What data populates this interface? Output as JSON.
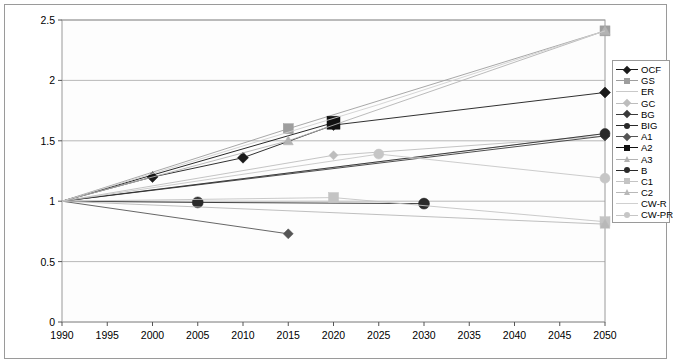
{
  "chart_data": {
    "type": "line",
    "title": "",
    "xlabel": "",
    "ylabel": "index (1990 = 1)",
    "xlim": [
      1990,
      2050
    ],
    "ylim": [
      0,
      2.5
    ],
    "yticks": [
      "0",
      "0.5",
      "1",
      "1.5",
      "2",
      "2.5"
    ],
    "ytick_values": [
      0,
      0.5,
      1,
      1.5,
      2,
      2.5
    ],
    "xticks": [
      "1990",
      "1995",
      "2000",
      "2005",
      "2010",
      "2015",
      "2020",
      "2025",
      "2030",
      "2035",
      "2040",
      "2045",
      "2050"
    ],
    "xtick_values": [
      1990,
      1995,
      2000,
      2005,
      2010,
      2015,
      2020,
      2025,
      2030,
      2035,
      2040,
      2045,
      2050
    ],
    "grid": "horizontal",
    "legend_position": "right",
    "series": [
      {
        "name": "OCF",
        "color": "#1a1a1a",
        "marker": "diamond",
        "marker_size": 5.5,
        "x": [
          1990,
          2000,
          2010,
          2020,
          2050
        ],
        "y": [
          1.0,
          1.2,
          1.36,
          1.63,
          1.9
        ]
      },
      {
        "name": "GS",
        "color": "#9e9e9e",
        "marker": "square",
        "marker_size": 5,
        "x": [
          1990,
          2015,
          2050
        ],
        "y": [
          1.0,
          1.6,
          2.41
        ]
      },
      {
        "name": "ER",
        "color": "#c9c9c9",
        "marker": "none",
        "marker_size": 0,
        "x": [
          1990,
          2050
        ],
        "y": [
          1.0,
          1.56
        ]
      },
      {
        "name": "GC",
        "color": "#bdbdbd",
        "marker": "diamond",
        "marker_size": 4.5,
        "x": [
          1990,
          2020,
          2050
        ],
        "y": [
          1.0,
          1.38,
          1.54
        ]
      },
      {
        "name": "BG",
        "color": "#3a3a3a",
        "marker": "diamond",
        "marker_size": 5,
        "x": [
          1990,
          2050
        ],
        "y": [
          1.0,
          1.54
        ]
      },
      {
        "name": "BIG",
        "color": "#2a2a2a",
        "marker": "circle",
        "marker_size": 5,
        "x": [
          1990,
          2050
        ],
        "y": [
          1.0,
          1.56
        ]
      },
      {
        "name": "A1",
        "color": "#555555",
        "marker": "diamond",
        "marker_size": 5,
        "x": [
          1990,
          2015
        ],
        "y": [
          1.0,
          0.73
        ]
      },
      {
        "name": "A2",
        "color": "#111111",
        "marker": "square",
        "marker_size": 6.5,
        "x": [
          1990,
          2020
        ],
        "y": [
          1.0,
          1.65
        ]
      },
      {
        "name": "A3",
        "color": "#b3b3b3",
        "marker": "triangle",
        "marker_size": 5,
        "x": [
          1990,
          2015,
          2050
        ],
        "y": [
          1.0,
          1.5,
          2.41
        ]
      },
      {
        "name": "B",
        "color": "#2a2a2a",
        "marker": "circle",
        "marker_size": 5.5,
        "x": [
          1990,
          2005,
          2030
        ],
        "y": [
          1.0,
          0.99,
          0.98
        ]
      },
      {
        "name": "C1",
        "color": "#c4c4c4",
        "marker": "square",
        "marker_size": 5,
        "x": [
          1990,
          2020,
          2050
        ],
        "y": [
          1.0,
          1.03,
          0.83
        ]
      },
      {
        "name": "C2",
        "color": "#b8b8b8",
        "marker": "triangle",
        "marker_size": 5,
        "x": [
          1990,
          2050
        ],
        "y": [
          1.0,
          0.81
        ]
      },
      {
        "name": "CW-R",
        "color": "#d0d0d0",
        "marker": "none",
        "marker_size": 0,
        "x": [
          1990,
          2025,
          2050
        ],
        "y": [
          1.0,
          1.8,
          2.41
        ]
      },
      {
        "name": "CW-PR",
        "color": "#c6c6c6",
        "marker": "circle",
        "marker_size": 5,
        "x": [
          1990,
          2025,
          2050
        ],
        "y": [
          1.0,
          1.39,
          1.19
        ]
      }
    ]
  },
  "legend": {
    "items": [
      {
        "label": "OCF"
      },
      {
        "label": "GS"
      },
      {
        "label": "ER"
      },
      {
        "label": "GC"
      },
      {
        "label": "BG"
      },
      {
        "label": "BIG"
      },
      {
        "label": "A1"
      },
      {
        "label": "A2"
      },
      {
        "label": "A3"
      },
      {
        "label": "B"
      },
      {
        "label": "C1"
      },
      {
        "label": "C2"
      },
      {
        "label": "CW-R"
      },
      {
        "label": "CW-PR"
      }
    ]
  },
  "axes": {
    "y_title": "index (1990 = 1)"
  }
}
